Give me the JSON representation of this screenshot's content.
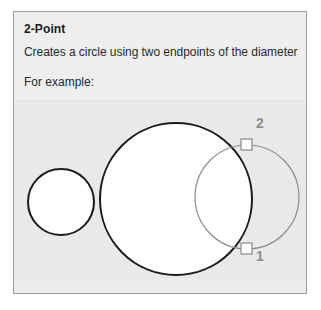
{
  "tooltip": {
    "title": "2-Point",
    "description": "Creates a circle using two endpoints of the diameter",
    "example_label": "For example:",
    "background_color": "#ebebeb",
    "border_color": "#9a9a9a",
    "text_color": "#2a2a2a"
  },
  "illustration": {
    "background_color": "#e9e9e9",
    "stroke_dark": "#1a1a1a",
    "stroke_light": "#8c8c8c",
    "fill_white": "#ffffff",
    "marker_fill": "#fdfdfd",
    "marker_stroke": "#8a8a8a",
    "label_color": "#8f8f8f",
    "circles": [
      {
        "name": "small-circle",
        "cx": 47,
        "cy": 101,
        "r": 33,
        "stroke": "dark"
      },
      {
        "name": "large-circle",
        "cx": 162,
        "cy": 98,
        "r": 76,
        "stroke": "dark"
      },
      {
        "name": "preview-circle",
        "cx": 233,
        "cy": 96,
        "r": 52,
        "stroke": "light"
      }
    ],
    "points": [
      {
        "label": "2",
        "x": 233,
        "y": 44,
        "label_x": 242,
        "label_y": 27
      },
      {
        "label": "1",
        "x": 233,
        "y": 148,
        "label_x": 242,
        "label_y": 160
      }
    ]
  }
}
